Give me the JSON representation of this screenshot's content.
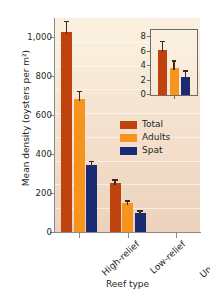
{
  "chart_data": {
    "type": "bar",
    "title": "",
    "xlabel": "Reef type",
    "ylabel": "Mean density (oysters per m²)",
    "categories": [
      "High-relief",
      "Low-relief",
      "Unrestored"
    ],
    "ylim": [
      0,
      1100
    ],
    "yticks": [
      0,
      200,
      400,
      600,
      800,
      1000
    ],
    "ytick_labels": [
      "0",
      "200",
      "400",
      "600",
      "800",
      "1,000"
    ],
    "grid": false,
    "legend_position": "center-right",
    "series": [
      {
        "name": "Total",
        "color": "#c0430f",
        "values": [
          1030,
          250,
          0
        ],
        "errors": [
          55,
          20,
          0
        ]
      },
      {
        "name": "Adults",
        "color": "#f7941e",
        "values": [
          685,
          148,
          0
        ],
        "errors": [
          40,
          14,
          0
        ]
      },
      {
        "name": "Spat",
        "color": "#1b2a74",
        "values": [
          345,
          100,
          0
        ],
        "errors": [
          22,
          12,
          0
        ]
      }
    ],
    "inset": {
      "type": "bar",
      "ylim": [
        0,
        8.6
      ],
      "yticks": [
        0,
        2,
        4,
        6,
        8
      ],
      "ytick_labels": [
        "0",
        "2",
        "4",
        "6",
        "8"
      ],
      "categories": [
        "Unrestored"
      ],
      "series": [
        {
          "name": "Total",
          "color": "#c0430f",
          "values": [
            6.2
          ],
          "errors": [
            1.3
          ]
        },
        {
          "name": "Adults",
          "color": "#f7941e",
          "values": [
            3.7
          ],
          "errors": [
            1.1
          ]
        },
        {
          "name": "Spat",
          "color": "#1b2a74",
          "values": [
            2.5
          ],
          "errors": [
            0.9
          ]
        }
      ]
    }
  },
  "axes": {
    "y_title": "Mean density (oysters per m²)",
    "x_title": "Reef type",
    "y_labels": [
      "1,000",
      "800",
      "600",
      "400",
      "200",
      "0"
    ],
    "x_labels": [
      "High-relief",
      "Low-relief",
      "Unrestored"
    ]
  },
  "legend": {
    "items": [
      {
        "label": "Total",
        "color": "#c0430f"
      },
      {
        "label": "Adults",
        "color": "#f7941e"
      },
      {
        "label": "Spat",
        "color": "#1b2a74"
      }
    ]
  },
  "inset_axis": {
    "y_labels": [
      "8",
      "6",
      "4",
      "2",
      "0"
    ]
  },
  "colors": {
    "total": "#c0430f",
    "adults": "#f7941e",
    "spat": "#1b2a74",
    "panel_top": "#fbf0df",
    "panel_bottom": "#ecd2bd",
    "axis": "#8a8a8a",
    "text": "#231f20"
  }
}
